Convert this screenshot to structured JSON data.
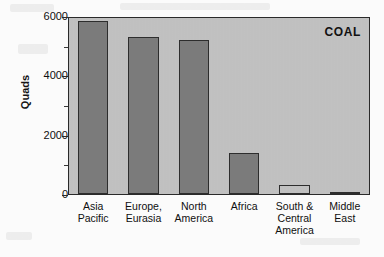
{
  "chart_data": {
    "type": "bar",
    "title": "COAL",
    "xlabel": "",
    "ylabel": "Quads",
    "ylim": [
      0,
      6000
    ],
    "yticks": [
      0,
      2000,
      4000,
      6000
    ],
    "ytick_labels": [
      "0",
      "2000",
      "4000",
      "6000"
    ],
    "minor_ticks": [
      1000,
      3000,
      5000
    ],
    "grid": false,
    "legend": "none",
    "categories": [
      "Asia Pacific",
      "Europe, Eurasia",
      "North America",
      "Africa",
      "South & Central America",
      "Middle East"
    ],
    "category_lines": [
      [
        "Asia",
        "Pacific"
      ],
      [
        "Europe,",
        "Eurasia"
      ],
      [
        "North",
        "America"
      ],
      [
        "Africa"
      ],
      [
        "South &",
        "Central",
        "America"
      ],
      [
        "Middle",
        "East"
      ]
    ],
    "values": [
      5900,
      5350,
      5250,
      1400,
      310,
      60
    ],
    "bar_styles": [
      "filled",
      "filled",
      "filled",
      "filled",
      "hollow",
      "filled"
    ],
    "colors": {
      "bar_fill": "#7c7c7c",
      "bar_edge": "#2e2e2e",
      "plot_background": "#c2c2c2",
      "page_background": "#fdfdfd",
      "text": "#101010"
    }
  }
}
